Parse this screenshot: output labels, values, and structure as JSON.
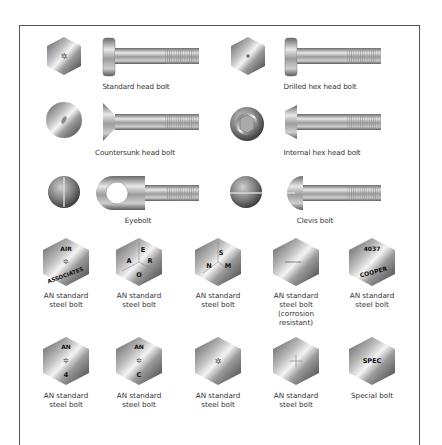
{
  "figure": {
    "title": "",
    "bolt_types": [
      {
        "id": "standard-head",
        "label": "Standard head bolt",
        "head_view": "hex",
        "head_mark": "star"
      },
      {
        "id": "drilled-hex-head",
        "label": "Drilled hex head bolt",
        "head_view": "hex",
        "head_mark": "drilled-hole"
      },
      {
        "id": "countersunk-head",
        "label": "Countersunk head bolt",
        "head_view": "round",
        "head_mark": "slot"
      },
      {
        "id": "internal-hex-head",
        "label": "Internal hex head bolt",
        "head_view": "round",
        "head_mark": "hex-socket"
      },
      {
        "id": "eyebolt",
        "label": "Eyebolt",
        "head_view": "round",
        "head_mark": "vertical-slot"
      },
      {
        "id": "clevis",
        "label": "Clevis bolt",
        "head_view": "round",
        "head_mark": "horizontal-slot"
      }
    ],
    "head_markings": [
      {
        "label_lines": [
          "AN standard",
          "steel bolt"
        ],
        "marks": {
          "top": "AIR",
          "center": "✲",
          "arc": "ASSOCIATES"
        }
      },
      {
        "label_lines": [
          "AN standard",
          "steel bolt"
        ],
        "marks": {
          "letters": [
            "E",
            "A",
            "R",
            "O"
          ]
        }
      },
      {
        "label_lines": [
          "AN standard",
          "steel bolt"
        ],
        "marks": {
          "letters": [
            "S",
            "N",
            "M"
          ]
        }
      },
      {
        "label_lines": [
          "AN standard",
          "steel bolt",
          "(corrosion",
          "resistant)"
        ],
        "marks": {
          "dash": "—"
        }
      },
      {
        "label_lines": [
          "AN standard",
          "steel bolt"
        ],
        "marks": {
          "top": "4037",
          "arc": "COOPER"
        }
      },
      {
        "label_lines": [
          "AN standard",
          "steel bolt"
        ],
        "marks": {
          "top": "AN",
          "center": "✲",
          "bottom": "4"
        }
      },
      {
        "label_lines": [
          "AN standard",
          "steel bolt"
        ],
        "marks": {
          "top": "AN",
          "center": "✲",
          "bottom": "C"
        }
      },
      {
        "label_lines": [
          "AN standard",
          "steel bolt"
        ],
        "marks": {
          "center": "✲"
        }
      },
      {
        "label_lines": [
          "AN standard",
          "steel bolt"
        ],
        "marks": {
          "center": "+"
        }
      },
      {
        "label_lines": [
          "Special bolt"
        ],
        "marks": {
          "center": "SPEC"
        }
      }
    ]
  }
}
